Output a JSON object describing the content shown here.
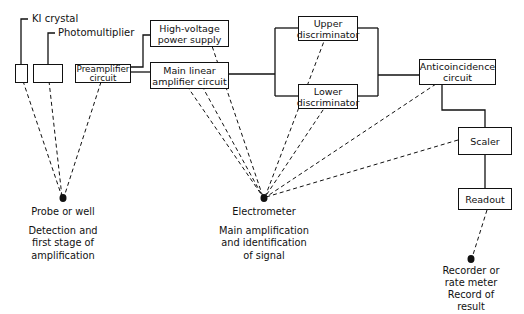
{
  "diagram": {
    "component_labels": {
      "ki_crystal": "KI crystal",
      "photomultiplier": "Photomultiplier"
    },
    "boxes": {
      "preamplifier": [
        "Preamplifier",
        "circuit"
      ],
      "hv_supply": [
        "High-voltage",
        "power supply"
      ],
      "main_amp": [
        "Main linear",
        "amplifier circuit"
      ],
      "upper_disc": [
        "Upper",
        "discriminator"
      ],
      "lower_disc": [
        "Lower",
        "discriminator"
      ],
      "anticoincidence": [
        "Anticoincidence",
        "circuit"
      ],
      "scaler": [
        "Scaler"
      ],
      "readout": [
        "Readout"
      ]
    },
    "stages": [
      {
        "name": "Probe or well",
        "description": [
          "Detection and",
          "first stage of",
          "amplification"
        ]
      },
      {
        "name": "Electrometer",
        "description": [
          "Main amplification",
          "and identification",
          "of signal"
        ]
      },
      {
        "name": "Recorder or",
        "name2": "rate meter",
        "description": [
          "Record of",
          "result"
        ]
      }
    ],
    "colors": {
      "line": "#111111",
      "background": "#ffffff"
    }
  }
}
